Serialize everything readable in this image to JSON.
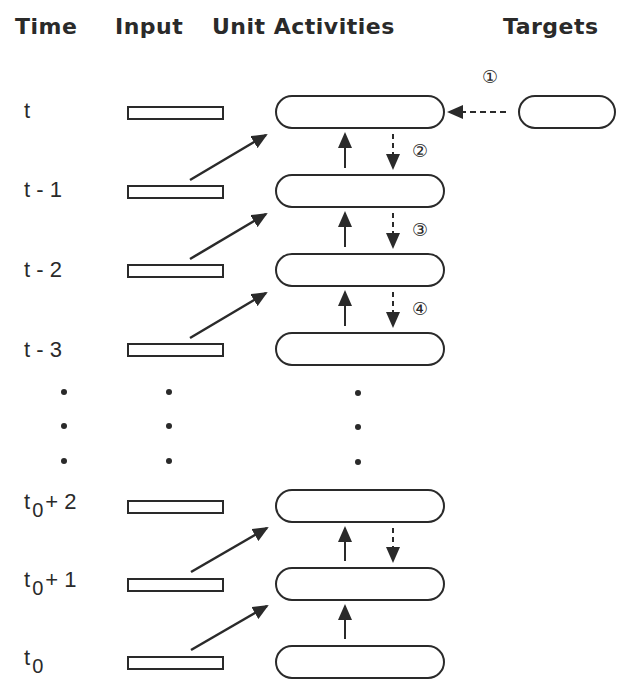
{
  "headers": {
    "time": "Time",
    "input": "Input",
    "unit_activities": "Unit Activities",
    "targets": "Targets"
  },
  "rows": [
    {
      "time_base": "t",
      "time_sub": "",
      "time_suffix": ""
    },
    {
      "time_base": "t - 1",
      "time_sub": "",
      "time_suffix": ""
    },
    {
      "time_base": "t - 2",
      "time_sub": "",
      "time_suffix": ""
    },
    {
      "time_base": "t - 3",
      "time_sub": "",
      "time_suffix": ""
    },
    {
      "time_base": "t",
      "time_sub": "0",
      "time_suffix": "+ 2"
    },
    {
      "time_base": "t",
      "time_sub": "0",
      "time_suffix": "+ 1"
    },
    {
      "time_base": "t",
      "time_sub": "0",
      "time_suffix": ""
    }
  ],
  "step_markers": {
    "step1": "①",
    "step2": "②",
    "step3": "③",
    "step4": "④"
  },
  "ellipsis": "vertical-dots",
  "colors": {
    "ink": "#2a2a2a",
    "background": "#ffffff"
  }
}
